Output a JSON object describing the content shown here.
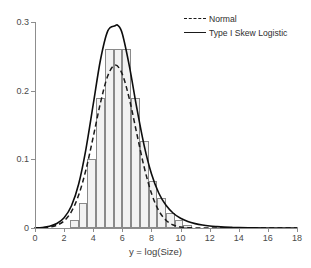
{
  "chart_data": {
    "type": "bar",
    "title": "",
    "subtitle": "",
    "xlabel": "y = log(Size)",
    "ylabel": "",
    "xlim": [
      0,
      18
    ],
    "ylim": [
      0,
      0.3
    ],
    "grid": false,
    "legend_position": "top-right",
    "xticks": [
      0,
      2,
      4,
      6,
      8,
      10,
      12,
      14,
      16,
      18
    ],
    "xtick_labels": [
      "0",
      "2",
      "4",
      "6",
      "8",
      "10",
      "12",
      "14",
      "16",
      "18"
    ],
    "yticks": [
      0,
      0.1,
      0.2,
      0.3
    ],
    "ytick_labels": [
      "0",
      "0.1",
      "0.2",
      "0.3"
    ],
    "histogram": {
      "bin_width": 0.6,
      "bin_edges": [
        2.4,
        3.0,
        3.6,
        4.2,
        4.8,
        5.4,
        6.0,
        6.6,
        7.2,
        7.8,
        8.4,
        9.0,
        9.6,
        10.2,
        10.8
      ],
      "densities": [
        0.012,
        0.036,
        0.101,
        0.19,
        0.26,
        0.26,
        0.26,
        0.19,
        0.126,
        0.068,
        0.044,
        0.022,
        0.012,
        0.005
      ],
      "fill_color": "#f2f2f2",
      "edge_color": "#8a8a8a"
    },
    "series": [
      {
        "name": "Normal",
        "style": "dashed",
        "color": "#1a1a1a",
        "x": [
          0.0,
          0.5,
          1.0,
          1.5,
          2.0,
          2.5,
          3.0,
          3.5,
          4.0,
          4.5,
          5.0,
          5.5,
          6.0,
          6.5,
          7.0,
          7.5,
          8.0,
          8.5,
          9.0,
          9.5,
          10.0,
          10.5,
          11.0,
          11.5,
          12.0,
          12.5,
          13.0,
          13.5,
          14.0,
          15.0,
          16.0,
          17.0,
          18.0
        ],
        "values": [
          0.0001,
          0.0004,
          0.0013,
          0.004,
          0.0104,
          0.0238,
          0.0479,
          0.0849,
          0.1326,
          0.1825,
          0.2216,
          0.2372,
          0.2239,
          0.1864,
          0.1368,
          0.0886,
          0.0505,
          0.0254,
          0.0113,
          0.0044,
          0.0015,
          0.0005,
          0.0001,
          3e-05,
          1e-05,
          0.0,
          0.0,
          0.0,
          0.0,
          0.0,
          0.0,
          0.0,
          0.0
        ]
      },
      {
        "name": "Type I Skew Logistic",
        "style": "solid",
        "color": "#1a1a1a",
        "x": [
          0.0,
          0.5,
          1.0,
          1.5,
          2.0,
          2.5,
          3.0,
          3.5,
          4.0,
          4.5,
          5.0,
          5.5,
          5.7,
          6.0,
          6.5,
          7.0,
          7.5,
          8.0,
          8.5,
          9.0,
          9.5,
          10.0,
          10.5,
          11.0,
          11.5,
          12.0,
          12.5,
          13.0,
          13.5,
          14.0,
          15.0,
          16.0,
          17.0,
          18.0
        ],
        "values": [
          0.0002,
          0.0008,
          0.0025,
          0.0065,
          0.015,
          0.032,
          0.064,
          0.115,
          0.18,
          0.245,
          0.287,
          0.2945,
          0.295,
          0.283,
          0.234,
          0.174,
          0.12,
          0.079,
          0.051,
          0.033,
          0.0215,
          0.0142,
          0.0095,
          0.0064,
          0.0043,
          0.0029,
          0.002,
          0.0013,
          0.0009,
          0.0006,
          0.0003,
          0.0001,
          5e-05,
          2e-05
        ]
      }
    ]
  },
  "legend": {
    "items": [
      {
        "label": "Normal",
        "style": "dashed"
      },
      {
        "label": "Type I Skew Logistic",
        "style": "solid"
      }
    ]
  }
}
